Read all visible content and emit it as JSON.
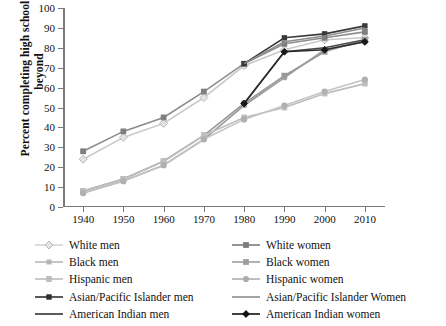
{
  "chart_data": {
    "type": "line",
    "title": "",
    "xlabel": "",
    "ylabel": "Percent completing high school or beyond",
    "categories": [
      1940,
      1950,
      1960,
      1970,
      1980,
      1990,
      2000,
      2010
    ],
    "xlim": [
      1935,
      2015
    ],
    "ylim": [
      0,
      100
    ],
    "yticks": [
      0,
      10,
      20,
      30,
      40,
      50,
      60,
      70,
      80,
      90,
      100
    ],
    "xticks": [
      1940,
      1950,
      1960,
      1970,
      1980,
      1990,
      2000,
      2010
    ],
    "grid": false,
    "legend_position": "bottom",
    "series": [
      {
        "name": "White men",
        "marker": "diamond-open",
        "color": "#d8d8d8",
        "line_color": "#c9c9c9",
        "values": [
          24,
          35,
          42,
          55,
          71,
          79,
          84,
          85
        ]
      },
      {
        "name": "White women",
        "marker": "square",
        "color": "#7f7f7f",
        "line_color": "#8c8c8c",
        "values": [
          28,
          38,
          45,
          58,
          72,
          82,
          85,
          88
        ]
      },
      {
        "name": "Black men",
        "marker": "square-small",
        "color": "#a8a8a8",
        "line_color": "#9a9a9a",
        "values": [
          7,
          13,
          21,
          34,
          51,
          65,
          79,
          83
        ]
      },
      {
        "name": "Black women",
        "marker": "square",
        "color": "#9a9a9a",
        "line_color": "#9a9a9a",
        "values": [
          8,
          14,
          23,
          36,
          52,
          66,
          78,
          84
        ]
      },
      {
        "name": "Hispanic men",
        "marker": "square-round",
        "color": "#c0c0c0",
        "line_color": "#bdbdbd",
        "values": [
          8,
          14,
          23,
          36,
          45,
          50,
          57,
          62
        ]
      },
      {
        "name": "Hispanic women",
        "marker": "circle",
        "color": "#b0b0b0",
        "line_color": "#c4c4c4",
        "values": [
          7,
          13,
          21,
          34,
          44,
          51,
          58,
          64
        ]
      },
      {
        "name": "Asian/Pacific Islander men",
        "marker": "square-dark",
        "color": "#3a3a3a",
        "line_color": "#3a3a3a",
        "values": [
          null,
          null,
          null,
          null,
          72,
          85,
          87,
          91
        ]
      },
      {
        "name": "Asian/Pacific Islander Women",
        "marker": "none",
        "color": "#8e8e8e",
        "line_color": "#8e8e8e",
        "values": [
          null,
          null,
          null,
          null,
          72,
          83,
          86,
          90
        ]
      },
      {
        "name": "American Indian men",
        "marker": "none",
        "color": "#4a4a4a",
        "line_color": "#4a4a4a",
        "values": [
          null,
          null,
          null,
          null,
          52,
          78,
          80,
          84
        ]
      },
      {
        "name": "American Indian women",
        "marker": "diamond-filled",
        "color": "#1a1a1a",
        "line_color": "#2a2a2a",
        "values": [
          null,
          null,
          null,
          null,
          52,
          78,
          79,
          83
        ]
      }
    ],
    "legend": [
      {
        "label": "White men",
        "marker": "diamond-open",
        "color": "#d5d5d5"
      },
      {
        "label": "Black men",
        "marker": "square-small",
        "color": "#b6b6b6"
      },
      {
        "label": "Hispanic men",
        "marker": "square-round",
        "color": "#bdbdbd"
      },
      {
        "label": "Asian/Pacific Islander men",
        "marker": "square-dark",
        "color": "#2f2f2f"
      },
      {
        "label": "American Indian men",
        "marker": "none",
        "color": "#4a4a4a"
      },
      {
        "label": "White women",
        "marker": "square",
        "color": "#7b7b7b"
      },
      {
        "label": "Black women",
        "marker": "square",
        "color": "#9d9d9d"
      },
      {
        "label": "Hispanic women",
        "marker": "circle",
        "color": "#aeaeae"
      },
      {
        "label": "Asian/Pacific Islander Women",
        "marker": "none",
        "color": "#9a9a9a"
      },
      {
        "label": "American Indian women",
        "marker": "diamond-filled",
        "color": "#111111"
      }
    ]
  }
}
